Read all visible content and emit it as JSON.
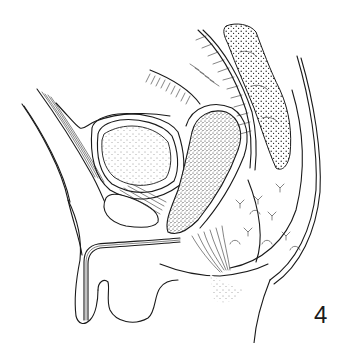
{
  "figure": {
    "number_label": "4",
    "style": "black-and-white anatomical line illustration",
    "view": "sagittal section of male pelvis",
    "colors": {
      "ink": "#1a1a1a",
      "background": "#ffffff"
    }
  }
}
